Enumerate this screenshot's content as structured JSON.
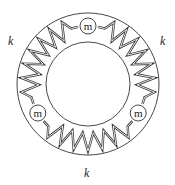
{
  "diagram": {
    "type": "mass-spring ring",
    "center": [
      88,
      84
    ],
    "outer_radius": 71,
    "inner_radius": 42,
    "spring_radius": 58,
    "mass_radius": 8,
    "masses": [
      {
        "label": "m",
        "angle_deg": -90
      },
      {
        "label": "m",
        "angle_deg": 150
      },
      {
        "label": "m",
        "angle_deg": 30
      }
    ],
    "springs": [
      {
        "label": "k",
        "position": "upper-left"
      },
      {
        "label": "k",
        "position": "upper-right"
      },
      {
        "label": "k",
        "position": "bottom"
      }
    ],
    "colors": {
      "stroke": "#333333",
      "background": "#ffffff"
    }
  },
  "labels": {
    "k_left": "k",
    "k_right": "k",
    "k_bottom": "k",
    "mass_top": "m",
    "mass_left": "m",
    "mass_right": "m"
  }
}
